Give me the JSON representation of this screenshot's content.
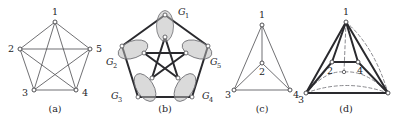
{
  "figure": {
    "background_color": "#ffffff",
    "ink_color": "#232327",
    "blob_fill_color": "#b8b8b8",
    "blob_stroke_color": "#6e6e72",
    "panels": [
      {
        "id": "a",
        "caption": "(a)",
        "graph_name": "K5 complete graph on five vertices",
        "vertex_labels": [
          "1",
          "2",
          "3",
          "4",
          "5"
        ],
        "edge_style": "thin solid"
      },
      {
        "id": "b",
        "caption": "(b)",
        "graph_name": "Pentagon with inner pentagram, vertices grouped in five blobs",
        "group_labels": [
          "G1",
          "G2",
          "G3",
          "G4",
          "G5"
        ],
        "group_label_bases": [
          "G",
          "G",
          "G",
          "G",
          "G"
        ],
        "group_label_subs": [
          "1",
          "2",
          "3",
          "4",
          "5"
        ],
        "edge_style": "thick solid"
      },
      {
        "id": "c",
        "caption": "(c)",
        "graph_name": "Planar drawing of K4",
        "vertex_labels": [
          "1",
          "2",
          "3",
          "4"
        ],
        "edge_style": "thin solid"
      },
      {
        "id": "d",
        "caption": "(d)",
        "graph_name": "Tetrahedral drawing with dashed hidden edges",
        "vertex_labels": [
          "1",
          "2",
          "4",
          "3"
        ],
        "edge_style": "thick solid with dashed hidden edges"
      }
    ],
    "captions": {
      "a": "(a)",
      "b": "(b)",
      "c": "(c)",
      "d": "(d)"
    },
    "panel_a": {
      "labels": {
        "v1": "1",
        "v2": "2",
        "v3": "3",
        "v4": "4",
        "v5": "5"
      }
    },
    "panel_b": {
      "labels": {
        "g1_base": "G",
        "g1_sub": "1",
        "g2_base": "G",
        "g2_sub": "2",
        "g3_base": "G",
        "g3_sub": "3",
        "g4_base": "G",
        "g4_sub": "4",
        "g5_base": "G",
        "g5_sub": "5"
      }
    },
    "panel_c": {
      "labels": {
        "v1": "1",
        "v2": "2",
        "v3": "3",
        "v4": "4"
      }
    },
    "panel_d": {
      "labels": {
        "v1": "1",
        "v2": "2",
        "v4": "4",
        "v3": "3"
      }
    }
  }
}
